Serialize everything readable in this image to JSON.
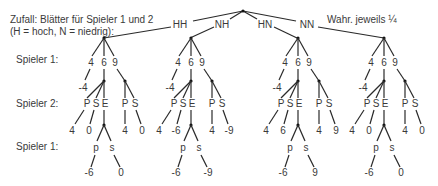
{
  "header": {
    "line1": "Zufall: Blätter für Spieler 1 und 2",
    "line2": "(H = hoch, N = niedrig):",
    "probability": "Wahr. jeweils ¼"
  },
  "row_labels": {
    "player1_top": "Spieler 1:",
    "player2": "Spieler 2:",
    "player1_bottom": "Spieler 1:"
  },
  "chance_branches": [
    "HH",
    "NH",
    "HN",
    "NN"
  ],
  "subtrees": [
    {
      "chance": "HH",
      "p1_choices": [
        "4",
        "6",
        "9"
      ],
      "fold_payoff": "-4",
      "p2_left_choices": [
        "P",
        "S",
        "E"
      ],
      "p2_right_choices": [
        "P",
        "S"
      ],
      "p2_payoffs": [
        "4",
        "0",
        "4",
        "0"
      ],
      "p1_final_choices": [
        "p",
        "s"
      ],
      "p1_final_payoffs": [
        "-6",
        "0"
      ]
    },
    {
      "chance": "NH",
      "p1_choices": [
        "4",
        "6",
        "9"
      ],
      "fold_payoff": "-4",
      "p2_left_choices": [
        "P",
        "S",
        "E"
      ],
      "p2_right_choices": [
        "P",
        "S"
      ],
      "p2_payoffs": [
        "4",
        "-6",
        "4",
        "-9"
      ],
      "p1_final_choices": [
        "p",
        "s"
      ],
      "p1_final_payoffs": [
        "-6",
        "-9"
      ]
    },
    {
      "chance": "HN",
      "p1_choices": [
        "4",
        "6",
        "9"
      ],
      "fold_payoff": "-4",
      "p2_left_choices": [
        "P",
        "S",
        "E"
      ],
      "p2_right_choices": [
        "P",
        "S"
      ],
      "p2_payoffs": [
        "4",
        "6",
        "4",
        "9"
      ],
      "p1_final_choices": [
        "p",
        "s"
      ],
      "p1_final_payoffs": [
        "-6",
        "9"
      ]
    },
    {
      "chance": "NN",
      "p1_choices": [
        "4",
        "6",
        "9"
      ],
      "fold_payoff": "-4",
      "p2_left_choices": [
        "P",
        "S",
        "E"
      ],
      "p2_right_choices": [
        "P",
        "S"
      ],
      "p2_payoffs": [
        "4",
        "0",
        "4",
        "0"
      ],
      "p1_final_choices": [
        "p",
        "s"
      ],
      "p1_final_payoffs": [
        "-6",
        "0"
      ]
    }
  ]
}
